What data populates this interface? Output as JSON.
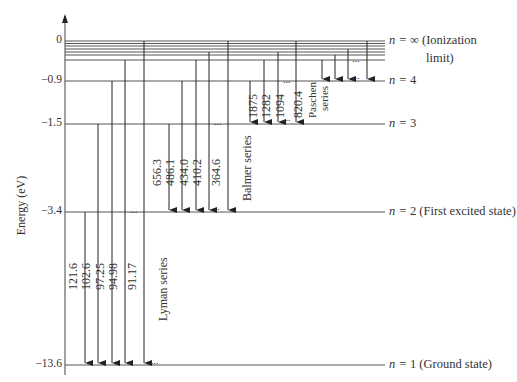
{
  "diagram": {
    "y_axis": {
      "label": "Energy (eV)",
      "ticks": [
        "0",
        "-0.9",
        "-1.5",
        "-3.4",
        "-13.6"
      ]
    },
    "levels": [
      {
        "n": "∞",
        "energy": "0",
        "label_prefix": "n =",
        "label_suffix": "(Ionization",
        "label_suffix2": "limit)"
      },
      {
        "n": "4",
        "energy": "-0.9",
        "label_prefix": "n =",
        "label_suffix": ""
      },
      {
        "n": "3",
        "energy": "-1.5",
        "label_prefix": "n =",
        "label_suffix": ""
      },
      {
        "n": "2",
        "energy": "-3.4",
        "label_prefix": "n =",
        "label_suffix": "(First excited state)"
      },
      {
        "n": "1",
        "energy": "-13.6",
        "label_prefix": "n =",
        "label_suffix": "(Ground state)"
      }
    ],
    "series": [
      {
        "name": "Lyman series",
        "wavelengths_nm": [
          "121.6",
          "102.6",
          "97.25",
          "94.98",
          "91.17"
        ],
        "ellipsis": "..."
      },
      {
        "name": "Balmer series",
        "wavelengths_nm": [
          "656.3",
          "486.1",
          "434.0",
          "410.2",
          "364.6"
        ],
        "ellipsis": "..."
      },
      {
        "name": "Paschen",
        "name_line2": "series",
        "wavelengths_nm": [
          "1875",
          "1282",
          "1094",
          "820.4"
        ],
        "ellipsis": "..."
      }
    ]
  }
}
